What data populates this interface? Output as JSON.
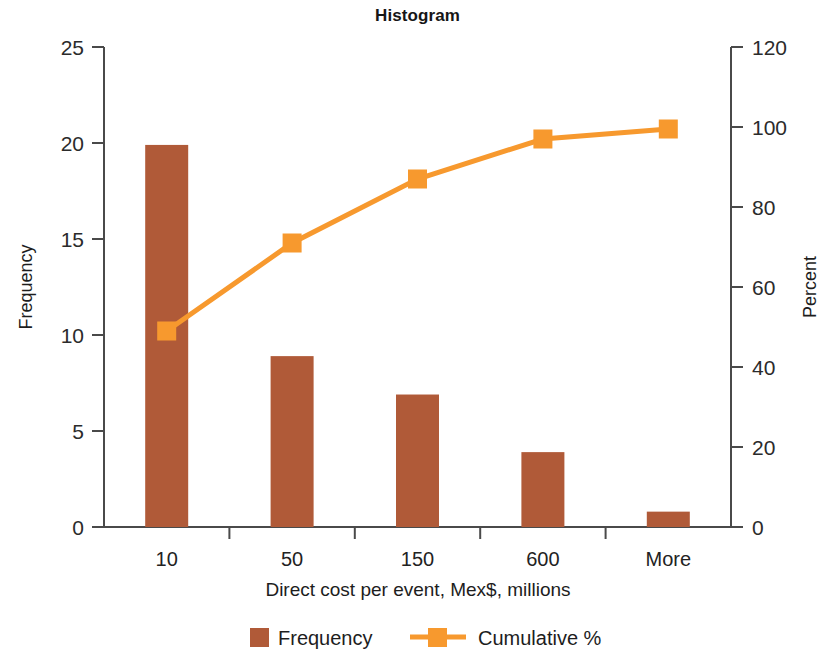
{
  "chart_data": {
    "type": "bar",
    "title": "Histogram",
    "xlabel": "Direct cost per event, Mex$, millions",
    "ylabel": "Frequency",
    "y2label": "Percent",
    "categories": [
      "10",
      "50",
      "150",
      "600",
      "More"
    ],
    "ylim": [
      0,
      25
    ],
    "y2lim": [
      0,
      120
    ],
    "yticks": [
      "0",
      "5",
      "10",
      "15",
      "20",
      "25"
    ],
    "ytick_values": [
      0,
      5,
      10,
      15,
      20,
      25
    ],
    "y2ticks": [
      "0",
      "20",
      "40",
      "60",
      "80",
      "100",
      "120"
    ],
    "y2tick_values": [
      0,
      20,
      40,
      60,
      80,
      100,
      120
    ],
    "grid": false,
    "legend_position": "bottom",
    "series": [
      {
        "name": "Frequency",
        "type": "bar",
        "axis": "left",
        "color": "#B05A38",
        "values": [
          19.9,
          8.9,
          6.9,
          3.9,
          0.8
        ]
      },
      {
        "name": "Cumulative %",
        "type": "line",
        "axis": "right",
        "color": "#F7992E",
        "marker": "square",
        "values": [
          49,
          71,
          87,
          97,
          99.5
        ]
      }
    ]
  },
  "legend": {
    "items": [
      {
        "label": "Frequency",
        "marker": "square-swatch",
        "color": "#B05A38"
      },
      {
        "label": "Cumulative %",
        "marker": "line-with-square",
        "color": "#F7992E"
      }
    ]
  }
}
